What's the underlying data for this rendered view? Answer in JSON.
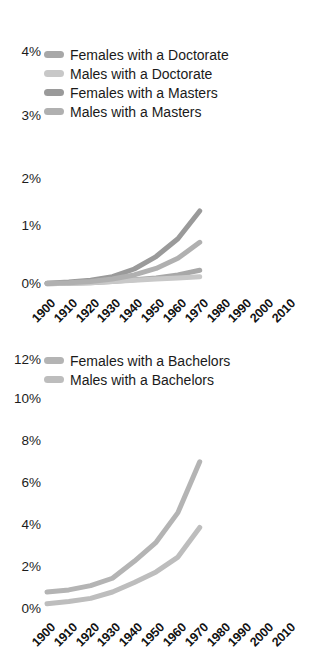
{
  "figure": {
    "background": "#ffffff",
    "panel_count": 2
  },
  "chart_data": [
    {
      "type": "line",
      "id": "advanced-degrees",
      "title": "",
      "xlabel": "",
      "ylabel": "",
      "x": [
        1900,
        1910,
        1920,
        1930,
        1940,
        1950,
        1960,
        1970,
        1980,
        1990,
        2000,
        2010
      ],
      "xlim": [
        1900,
        2010
      ],
      "ylim": [
        0,
        4
      ],
      "xtick_labels": [
        "1900",
        "1910",
        "1920",
        "1930",
        "1940",
        "1950",
        "1960",
        "1970",
        "1980",
        "1990",
        "2000",
        "2010"
      ],
      "ytick_labels": [
        "0%",
        "1%",
        "2%",
        "3%",
        "4%"
      ],
      "ytick_values": [
        0,
        1,
        2,
        3,
        4
      ],
      "grid": false,
      "legend_position": "top-left",
      "series": [
        {
          "name": "Females with a Doctorate",
          "color": "#a8a8a8",
          "values": [
            0.02,
            0.03,
            0.04,
            0.06,
            0.09,
            0.12,
            0.17,
            0.25,
            null,
            null,
            null,
            null
          ]
        },
        {
          "name": "Males with a Doctorate",
          "color": "#c8c8c8",
          "values": [
            0.02,
            0.03,
            0.04,
            0.06,
            0.08,
            0.1,
            0.12,
            0.14,
            null,
            null,
            null,
            null
          ]
        },
        {
          "name": "Females with a Masters",
          "color": "#9a9a9a",
          "values": [
            0.03,
            0.05,
            0.08,
            0.14,
            0.27,
            0.48,
            0.78,
            1.25,
            null,
            null,
            null,
            null
          ]
        },
        {
          "name": "Males with a Masters",
          "color": "#b0b0b0",
          "values": [
            0.03,
            0.04,
            0.06,
            0.1,
            0.17,
            0.28,
            0.45,
            0.72,
            null,
            null,
            null,
            null
          ]
        }
      ]
    },
    {
      "type": "line",
      "id": "bachelors-degrees",
      "title": "",
      "xlabel": "",
      "ylabel": "",
      "x": [
        1900,
        1910,
        1920,
        1930,
        1940,
        1950,
        1960,
        1970,
        1980,
        1990,
        2000,
        2010
      ],
      "xlim": [
        1900,
        2010
      ],
      "ylim": [
        0,
        12
      ],
      "xtick_labels": [
        "1900",
        "1910",
        "1920",
        "1930",
        "1940",
        "1950",
        "1960",
        "1970",
        "1980",
        "1990",
        "2000",
        "2010"
      ],
      "ytick_labels": [
        "0%",
        "2%",
        "4%",
        "6%",
        "8%",
        "10%",
        "12%"
      ],
      "ytick_values": [
        0,
        2,
        4,
        6,
        8,
        10,
        12
      ],
      "grid": false,
      "legend_position": "top-left",
      "series": [
        {
          "name": "Females with a Bachelors",
          "color": "#b4b4b4",
          "values": [
            0.85,
            0.95,
            1.15,
            1.5,
            2.3,
            3.2,
            4.6,
            7.0,
            null,
            null,
            null,
            null
          ]
        },
        {
          "name": "Males with a Bachelors",
          "color": "#bdbdbd",
          "values": [
            0.3,
            0.4,
            0.55,
            0.85,
            1.3,
            1.8,
            2.5,
            3.9,
            null,
            null,
            null,
            null
          ]
        }
      ]
    }
  ]
}
